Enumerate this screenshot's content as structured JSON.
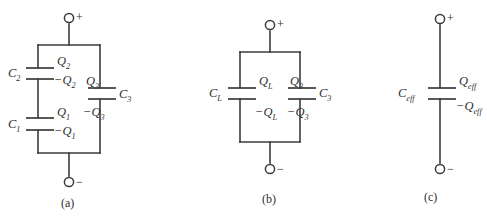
{
  "figure": {
    "type": "capacitor-network-reduction-diagram",
    "background_color": "#ffffff",
    "line_color": "#3b3b3b",
    "text_color": "#2d2d2d"
  },
  "panels": [
    {
      "id": "a",
      "caption": "(a)",
      "terminal_plus": "+",
      "terminal_minus": "−",
      "components": [
        {
          "name": "C2",
          "label": "C",
          "sub": "2",
          "charge_top": "Q",
          "charge_top_sub": "2",
          "charge_bottom": "−Q",
          "charge_bottom_sub": "2"
        },
        {
          "name": "C1",
          "label": "C",
          "sub": "1",
          "charge_top": "Q",
          "charge_top_sub": "1",
          "charge_bottom": "−Q",
          "charge_bottom_sub": "1"
        },
        {
          "name": "C3",
          "label": "C",
          "sub": "3",
          "charge_top": "Q",
          "charge_top_sub": "3",
          "charge_bottom": "−Q",
          "charge_bottom_sub": "3"
        }
      ]
    },
    {
      "id": "b",
      "caption": "(b)",
      "terminal_plus": "+",
      "terminal_minus": "−",
      "components": [
        {
          "name": "CL",
          "label": "C",
          "sub": "L",
          "charge_top": "Q",
          "charge_top_sub": "L",
          "charge_bottom": "−Q",
          "charge_bottom_sub": "L"
        },
        {
          "name": "C3",
          "label": "C",
          "sub": "3",
          "charge_top": "Q",
          "charge_top_sub": "3",
          "charge_bottom": "−Q",
          "charge_bottom_sub": "3"
        }
      ]
    },
    {
      "id": "c",
      "caption": "(c)",
      "terminal_plus": "+",
      "terminal_minus": "−",
      "components": [
        {
          "name": "Ceff",
          "label": "C",
          "sub": "eff",
          "charge_top": "Q",
          "charge_top_sub": "eff",
          "charge_bottom": "−Q",
          "charge_bottom_sub": "eff"
        }
      ]
    }
  ],
  "labels": {
    "a": {
      "C2": "C",
      "C2_sub": "2",
      "Q2": "Q",
      "Q2_sub": "2",
      "negQ2": "−Q",
      "negQ2_sub": "2",
      "C1": "C",
      "C1_sub": "1",
      "Q1": "Q",
      "Q1_sub": "1",
      "negQ1": "−Q",
      "negQ1_sub": "1",
      "C3": "C",
      "C3_sub": "3",
      "Q3": "Q",
      "Q3_sub": "3",
      "negQ3": "−Q",
      "negQ3_sub": "3",
      "plus": "+",
      "minus": "−",
      "caption": "(a)"
    },
    "b": {
      "CL": "C",
      "CL_sub": "L",
      "QL": "Q",
      "QL_sub": "L",
      "negQL": "−Q",
      "negQL_sub": "L",
      "C3": "C",
      "C3_sub": "3",
      "Q3": "Q",
      "Q3_sub": "3",
      "negQ3": "−Q",
      "negQ3_sub": "3",
      "plus": "+",
      "minus": "−",
      "caption": "(b)"
    },
    "c": {
      "Ceff": "C",
      "Ceff_sub": "eff",
      "Qeff": "Q",
      "Qeff_sub": "eff",
      "negQeff": "−Q",
      "negQeff_sub": "eff",
      "plus": "+",
      "minus": "−",
      "caption": "(c)"
    }
  }
}
